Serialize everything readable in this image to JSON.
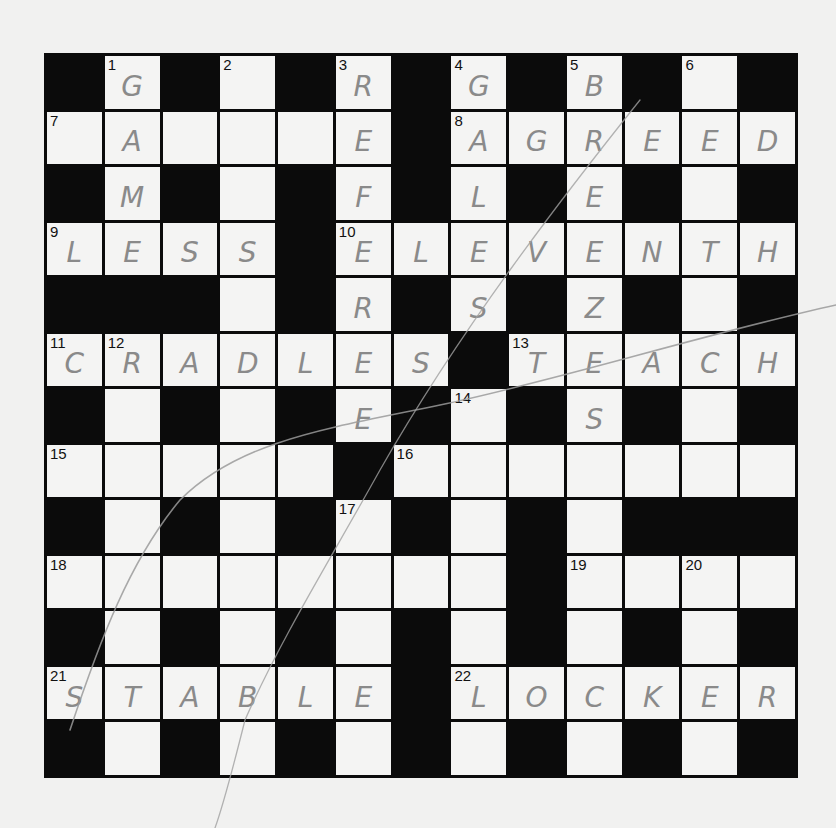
{
  "puzzle": {
    "rows": 13,
    "cols": 13,
    "layout": [
      "BWBWBWBWBWBWB",
      "WWWWWWBWWWWWW",
      "BWBWBWBWBWBWB",
      "WWWWBWWWWWWWW",
      "BBBWBWBWBWBWB",
      "WWWWWWWBWWWWW",
      "BWBWBWBWBWBWB",
      "WWWWWBWWWWWWW",
      "BWBWBWBWBWBBB",
      "WWWWWWWWBWWWW",
      "BWBWBWBWBWBWB",
      "WWWWWWBWWWWWW",
      "BWBWBWBWBWBWB"
    ],
    "numbers": {
      "0,1": "1",
      "0,3": "2",
      "0,5": "3",
      "0,7": "4",
      "0,9": "5",
      "0,11": "6",
      "1,0": "7",
      "1,7": "8",
      "3,0": "9",
      "3,5": "10",
      "5,0": "11",
      "5,1": "12",
      "5,8": "13",
      "6,7": "14",
      "7,0": "15",
      "7,6": "16",
      "8,5": "17",
      "9,0": "18",
      "9,9": "19",
      "9,11": "20",
      "11,0": "21",
      "11,7": "22"
    },
    "letters": {
      "0,1": "G",
      "0,5": "R",
      "0,7": "G",
      "0,9": "B",
      "1,1": "A",
      "1,5": "E",
      "1,7": "A",
      "1,8": "G",
      "1,9": "R",
      "1,10": "E",
      "1,11": "E",
      "1,12": "D",
      "2,1": "M",
      "2,5": "F",
      "2,7": "L",
      "2,9": "E",
      "3,0": "L",
      "3,1": "E",
      "3,2": "S",
      "3,3": "S",
      "3,5": "E",
      "3,6": "L",
      "3,7": "E",
      "3,8": "V",
      "3,9": "E",
      "3,10": "N",
      "3,11": "T",
      "3,12": "H",
      "4,5": "R",
      "4,7": "S",
      "4,9": "Z",
      "5,0": "C",
      "5,1": "R",
      "5,2": "A",
      "5,3": "D",
      "5,4": "L",
      "5,5": "E",
      "5,6": "S",
      "5,8": "T",
      "5,9": "E",
      "5,10": "A",
      "5,11": "C",
      "5,12": "H",
      "6,5": "E",
      "6,9": "S",
      "11,0": "S",
      "11,1": "T",
      "11,2": "A",
      "11,3": "B",
      "11,4": "L",
      "11,5": "E",
      "11,7": "L",
      "11,8": "O",
      "11,9": "C",
      "11,10": "K",
      "11,11": "E",
      "11,12": "R"
    },
    "answers_across": [
      {
        "number": "7",
        "answer": ""
      },
      {
        "number": "8",
        "answer": "AGREED"
      },
      {
        "number": "9",
        "answer": "LESS"
      },
      {
        "number": "10",
        "answer": "ELEVENTH"
      },
      {
        "number": "11",
        "answer": "CRADLES"
      },
      {
        "number": "13",
        "answer": "TEACH"
      },
      {
        "number": "15",
        "answer": ""
      },
      {
        "number": "16",
        "answer": ""
      },
      {
        "number": "18",
        "answer": ""
      },
      {
        "number": "19",
        "answer": ""
      },
      {
        "number": "21",
        "answer": "STABLE"
      },
      {
        "number": "22",
        "answer": "LOCKER"
      }
    ],
    "answers_down": [
      {
        "number": "1",
        "answer": "GAME"
      },
      {
        "number": "2",
        "answer": ""
      },
      {
        "number": "3",
        "answer": "REFEREE"
      },
      {
        "number": "4",
        "answer": "GALES"
      },
      {
        "number": "5",
        "answer": "BREEZES"
      },
      {
        "number": "6",
        "answer": ""
      },
      {
        "number": "12",
        "answer": ""
      },
      {
        "number": "14",
        "answer": ""
      },
      {
        "number": "17",
        "answer": ""
      },
      {
        "number": "20",
        "answer": ""
      }
    ]
  },
  "colors": {
    "paper": "#f1f1f0",
    "black_square": "#0b0b0b",
    "white_square": "#f4f4f3",
    "pencil": "#8a8a8a"
  }
}
